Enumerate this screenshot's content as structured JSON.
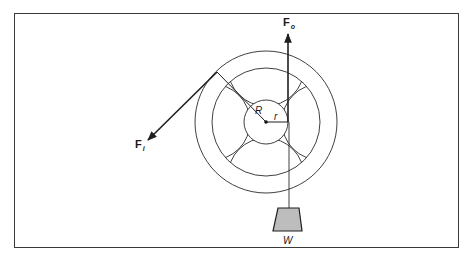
{
  "diagram": {
    "type": "wheel-and-axle",
    "labels": {
      "input_force": {
        "main": "F",
        "sub": "i"
      },
      "output_force": {
        "main": "F",
        "sub": "o"
      },
      "wheel_radius": "R",
      "axle_radius": "r",
      "weight": "W"
    },
    "colors": {
      "line": "#1f1f1f",
      "weight_fill": "#bdbdbd",
      "frame": "#3a3a3a"
    }
  }
}
